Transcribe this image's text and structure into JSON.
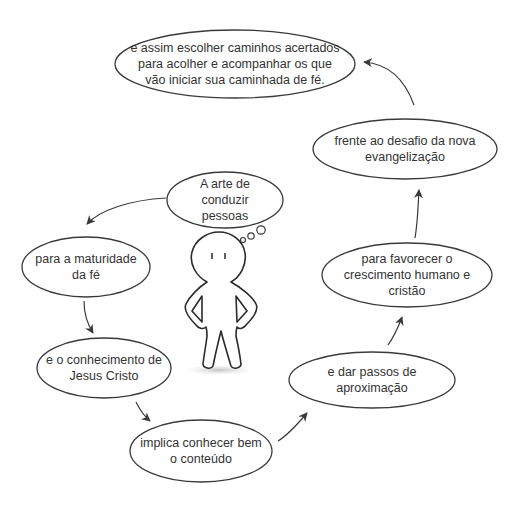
{
  "diagram": {
    "type": "cycle-flow",
    "stroke_color": "#3a3a3a",
    "text_color": "#333333",
    "background": "#ffffff",
    "center_figure": "stick-figure-thinking",
    "nodes": [
      {
        "id": "n0",
        "text": "A arte de conduzir\npessoas",
        "shape": "thought-bubble"
      },
      {
        "id": "n1",
        "text": "para a maturidade\nda fé",
        "shape": "ellipse"
      },
      {
        "id": "n2",
        "text": "e o conhecimento de\nJesus Cristo",
        "shape": "ellipse"
      },
      {
        "id": "n3",
        "text": "implica conhecer bem\no conteúdo",
        "shape": "ellipse"
      },
      {
        "id": "n4",
        "text": "e dar passos de\naproximação",
        "shape": "ellipse"
      },
      {
        "id": "n5",
        "text": "para favorecer o\ncrescimento humano e\ncristão",
        "shape": "ellipse"
      },
      {
        "id": "n6",
        "text": "frente ao desafio da nova\nevangelização",
        "shape": "ellipse"
      },
      {
        "id": "n7",
        "text": "e assim escolher caminhos acertados\npara acolher e acompanhar os que\nvão iniciar sua caminhada de fé.",
        "shape": "ellipse"
      }
    ],
    "edges": [
      {
        "from": "n0",
        "to": "n1"
      },
      {
        "from": "n1",
        "to": "n2"
      },
      {
        "from": "n2",
        "to": "n3"
      },
      {
        "from": "n3",
        "to": "n4"
      },
      {
        "from": "n4",
        "to": "n5"
      },
      {
        "from": "n5",
        "to": "n6"
      },
      {
        "from": "n6",
        "to": "n7"
      }
    ]
  }
}
